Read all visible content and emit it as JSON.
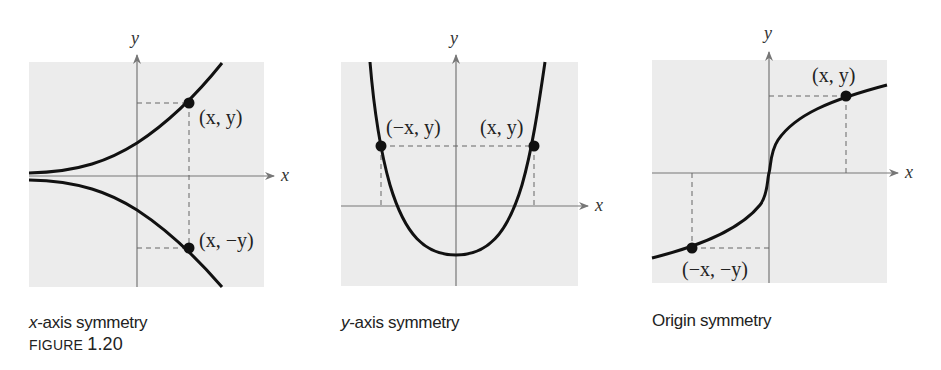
{
  "figure": {
    "label": "FIGURE",
    "number": "1.20"
  },
  "panels": [
    {
      "id": "x-axis-symmetry",
      "caption_var": "x",
      "caption_rest": "-axis symmetry",
      "axis_x": "x",
      "axis_y": "y",
      "point_labels": [
        "(x, y)",
        "(x, −y)"
      ]
    },
    {
      "id": "y-axis-symmetry",
      "caption_var": "y",
      "caption_rest": "-axis symmetry",
      "axis_x": "x",
      "axis_y": "y",
      "point_labels": [
        "(−x, y)",
        "(x, y)"
      ]
    },
    {
      "id": "origin-symmetry",
      "caption_var": "",
      "caption_rest": "Origin symmetry",
      "axis_x": "x",
      "axis_y": "y",
      "point_labels": [
        "(x, y)",
        "(−x, −y)"
      ]
    }
  ],
  "colors": {
    "panel_bg": "#ececec",
    "curve": "#111111",
    "axis": "#777777",
    "dash": "#666666"
  }
}
